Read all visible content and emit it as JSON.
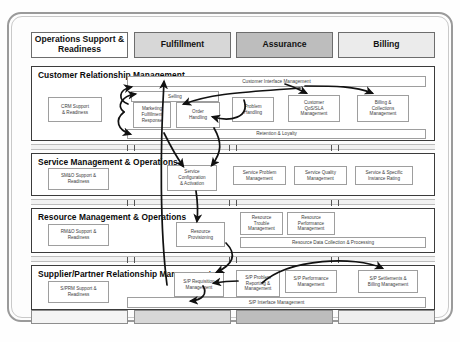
{
  "diagram": {
    "columns": [
      {
        "label": "Operations Support & Readiness",
        "shade": "shade0"
      },
      {
        "label": "Fulfillment",
        "shade": "shade1"
      },
      {
        "label": "Assurance",
        "shade": "shade2"
      },
      {
        "label": "Billing",
        "shade": "shade3"
      }
    ],
    "rows": [
      {
        "title": "Customer Relationship Management",
        "boxes": [
          {
            "label": "CRM Support\n& Readiness"
          },
          {
            "label": "Customer Interface Management"
          },
          {
            "label": "Selling"
          },
          {
            "label": "Marketing\nFulfillment\nResponse"
          },
          {
            "label": "Order\nHandling"
          },
          {
            "label": "Problem\nHandling"
          },
          {
            "label": "Customer\nQoS/SLA\nManagement"
          },
          {
            "label": "Billing &\nCollections\nManagement"
          },
          {
            "label": "Retention & Loyalty"
          }
        ]
      },
      {
        "title": "Service Management & Operations",
        "boxes": [
          {
            "label": "SM&O Support &\nReadiness"
          },
          {
            "label": "Service\nConfiguration\n& Activation"
          },
          {
            "label": "Service Problem\nManagement"
          },
          {
            "label": "Service Quality\nManagement"
          },
          {
            "label": "Service & Specific\nInstance Rating"
          }
        ]
      },
      {
        "title": "Resource Management & Operations",
        "boxes": [
          {
            "label": "RM&O Support &\nReadiness"
          },
          {
            "label": "Resource\nProvisioning"
          },
          {
            "label": "Resource\nTrouble\nManagement"
          },
          {
            "label": "Resource\nPerformance\nManagement"
          },
          {
            "label": "Resource Data Collection & Processing"
          }
        ]
      },
      {
        "title": "Supplier/Partner Relationship Management",
        "boxes": [
          {
            "label": "S/PRM Support &\nReadiness"
          },
          {
            "label": "S/P Requisition\nManagement"
          },
          {
            "label": "S/P Problem\nReporting &\nManagement"
          },
          {
            "label": "S/P Performance\nManagement"
          },
          {
            "label": "S/P Settlements &\nBilling Management"
          },
          {
            "label": "S/P Interface Management"
          }
        ]
      }
    ],
    "colors": {
      "frame_border": "#9a9a9a",
      "row_border": "#3b3b3b",
      "box_border": "#9e9e9e",
      "arrow": "#111111",
      "header_assurance": "#bdbdbd",
      "header_fulfillment": "#d7d7d7"
    }
  }
}
